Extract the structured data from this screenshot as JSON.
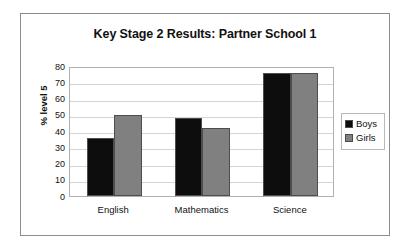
{
  "chart_data": {
    "type": "bar",
    "title": "Key Stage 2 Results: Partner School 1",
    "xlabel": "",
    "ylabel": "% level 5",
    "categories": [
      "English",
      "Mathematics",
      "Science"
    ],
    "series": [
      {
        "name": "Boys",
        "color": "#0d0d0d",
        "values": [
          36,
          48,
          76
        ]
      },
      {
        "name": "Girls",
        "color": "#808080",
        "values": [
          50,
          42,
          76
        ]
      }
    ],
    "ylim": [
      0,
      80
    ],
    "ytick_step": 10,
    "yticks": [
      80,
      70,
      60,
      50,
      40,
      30,
      20,
      10,
      0
    ],
    "ytick_labels": [
      "80",
      "70",
      "60",
      "50",
      "40",
      "30",
      "20",
      "10",
      "0"
    ],
    "grid": true,
    "grid_axis": "y",
    "legend_position": "right",
    "plot_background": "#ffffff",
    "border_color": "#8c8c8c"
  }
}
